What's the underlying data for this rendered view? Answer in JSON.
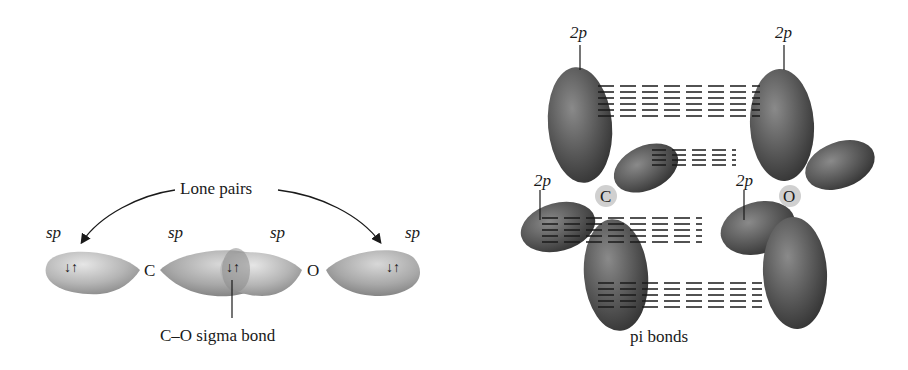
{
  "left_diagram": {
    "title_label": "Lone pairs",
    "orbital_labels": [
      "sp",
      "sp",
      "sp",
      "sp"
    ],
    "atoms": [
      "C",
      "O"
    ],
    "electron_pair_symbol": "↓↑",
    "bond_label": "C–O sigma bond"
  },
  "right_diagram": {
    "orbital_labels": [
      "2p",
      "2p",
      "2p",
      "2p"
    ],
    "atoms": [
      "C",
      "O"
    ],
    "bond_label": "pi bonds"
  },
  "colors": {
    "sp_orbital": "#b8b8b8",
    "p_orbital": "#5a5a5a",
    "text": "#1a1a1a"
  }
}
